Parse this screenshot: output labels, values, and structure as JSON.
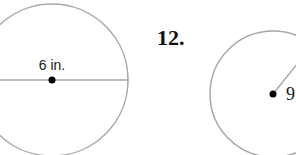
{
  "figure_left": {
    "label": "6 in.",
    "measure": "diameter",
    "circle": {
      "cx": 52,
      "cy": 80,
      "r": 76
    },
    "stroke_color": "#a8a8a8",
    "dot_color": "#000000"
  },
  "figure_right": {
    "problem_number": "12.",
    "label": "9",
    "measure": "radius",
    "circle": {
      "cx": 273,
      "cy": 94,
      "r": 63
    },
    "stroke_color": "#a8a8a8",
    "dot_color": "#000000"
  }
}
